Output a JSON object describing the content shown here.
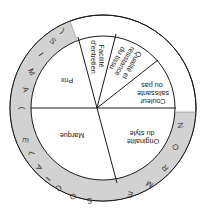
{
  "diagram": {
    "orientation": "rotated 180 degrees",
    "colors": {
      "ring_gray": "#d2d2d2",
      "ring_white": "#ffffff",
      "line": "#1a1a1a",
      "text": "#222222"
    },
    "segments": [
      {
        "id": "prix",
        "lines": [
          "Prix"
        ]
      },
      {
        "id": "facilite",
        "lines": [
          "Facilité",
          "d'entretien"
        ]
      },
      {
        "id": "qualite",
        "lines": [
          "Qualité et",
          "résistance",
          "du tissu"
        ]
      },
      {
        "id": "couleur",
        "lines": [
          "Couleur",
          "salissante",
          "ou pas"
        ]
      },
      {
        "id": "originalite",
        "lines": [
          "Originalité",
          "du style"
        ]
      },
      {
        "id": "marque",
        "lines": [
          "Marque"
        ]
      }
    ],
    "outer_ring": {
      "gray_letters": [
        "S",
        "O",
        "C",
        "I",
        "A",
        "L",
        "E",
        "(",
        "A",
        "M",
        "I",
        "S",
        ")"
      ],
      "norme_letters": [
        "N",
        "O",
        "R",
        "M",
        "E"
      ],
      "label_sociale": "SOCIALE (AMIS)",
      "label_norme": "NORME"
    }
  }
}
